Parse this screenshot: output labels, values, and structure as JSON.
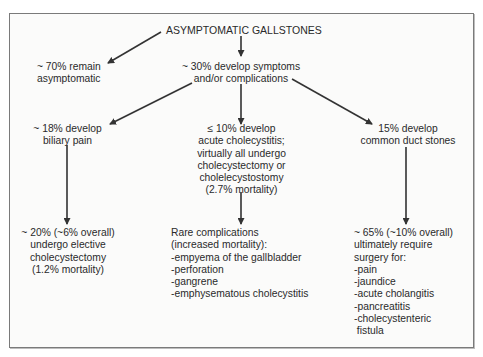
{
  "diagram": {
    "root": {
      "label": "ASYMPTOMATIC GALLSTONES"
    },
    "level1": {
      "remain": {
        "lines": [
          "~ 70% remain",
          "asymptomatic"
        ]
      },
      "symptoms": {
        "lines": [
          "~ 30% develop symptoms",
          "and/or complications"
        ]
      }
    },
    "level2": {
      "biliary": {
        "lines": [
          "~ 18% develop",
          "biliary pain"
        ]
      },
      "cholecystitis": {
        "lines": [
          "≤ 10% develop",
          "acute cholecystitis;",
          "virtually all undergo",
          "cholecystectomy or",
          "cholelecystostomy",
          "(2.7% mortality)"
        ]
      },
      "duct": {
        "lines": [
          "15% develop",
          "common duct stones"
        ]
      }
    },
    "level3": {
      "elective": {
        "lines": [
          "~ 20% (~6% overall)",
          "undergo elective",
          "cholecystectomy",
          "(1.2% mortality)"
        ]
      },
      "rare": {
        "lines": [
          "Rare complications",
          "(increased mortality):",
          "-empyema of the gallbladder",
          "-perforation",
          "-gangrene",
          "-emphysematous cholecystitis"
        ]
      },
      "surgery": {
        "lines": [
          "~ 65% (~10% overall)",
          "ultimately require",
          "surgery for:",
          "-pain",
          "-jaundice",
          "-acute cholangitis",
          "-pancreatitis",
          "-cholecystenteric",
          " fistula"
        ]
      }
    },
    "colors": {
      "line": "#333333",
      "border": "#7a7a7a",
      "text": "#2a2a2a"
    }
  }
}
